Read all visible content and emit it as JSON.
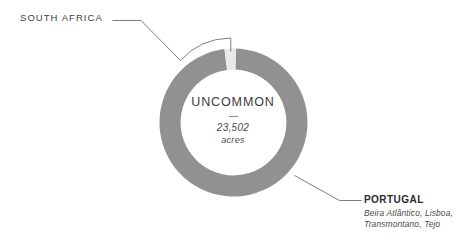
{
  "center": {
    "title": "UNCOMMON",
    "value": "23,502",
    "unit": "acres",
    "divider": "—"
  },
  "callouts": {
    "south_africa": {
      "name": "SOUTH AFRICA",
      "regions": ""
    },
    "portugal": {
      "name": "PORTUGAL",
      "regions_line1": "Beira Atlântico, Lisboa,",
      "regions_line2": "Transmontano, Tejo"
    }
  },
  "colors": {
    "background": "#ffffff",
    "segment_portugal": "#919191",
    "segment_south_africa": "#e9e9e9",
    "leader_line": "#6f6f6f",
    "text_dark": "#2b2b2b",
    "text_mid": "#4a4a4a"
  },
  "chart_data": {
    "type": "pie",
    "title": "UNCOMMON",
    "subtitle": "23,502 acres",
    "unit": "acres",
    "total": 23502,
    "donut": true,
    "inner_radius_ratio": 0.715,
    "start_angle_deg": -88,
    "legend": "callout-labels",
    "grid": false,
    "labels": [
      "PORTUGAL",
      "SOUTH AFRICA"
    ],
    "values": [
      97.5,
      2.5
    ],
    "series": [
      {
        "name": "acres share",
        "values": [
          97.5,
          2.5
        ]
      }
    ],
    "slices": [
      {
        "label": "PORTUGAL",
        "sublabel": "Beira Atlântico, Lisboa, Transmontano, Tejo",
        "value": 97.5,
        "color": "#919191"
      },
      {
        "label": "SOUTH AFRICA",
        "sublabel": "",
        "value": 2.5,
        "color": "#e9e9e9"
      }
    ]
  }
}
